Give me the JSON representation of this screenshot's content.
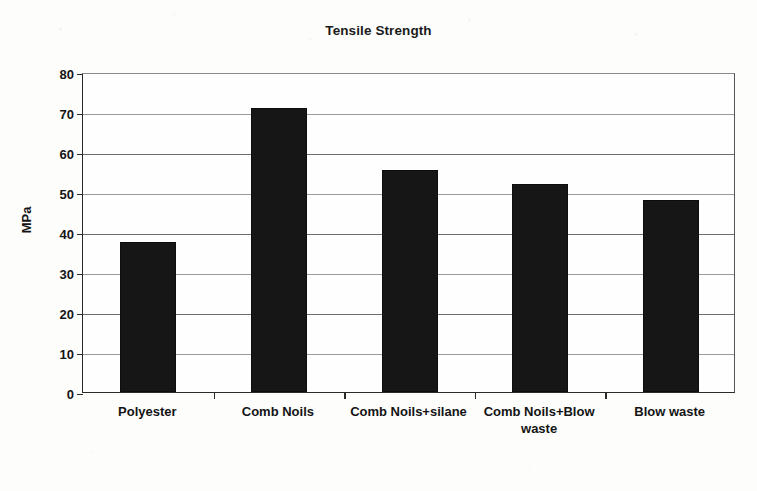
{
  "chart_data": {
    "type": "bar",
    "title": "Tensile Strength",
    "xlabel": "",
    "ylabel": "MPa",
    "categories": [
      "Polyester",
      "Comb Noils",
      "Comb Noils+silane",
      "Comb Noils+Blow waste",
      "Blow waste"
    ],
    "values": [
      37.5,
      71,
      55.5,
      52,
      48
    ],
    "ylim": [
      0,
      80
    ],
    "yticks": [
      0,
      10,
      20,
      30,
      40,
      50,
      60,
      70,
      80
    ],
    "ytick_labels": [
      "0",
      "10",
      "20",
      "30",
      "40",
      "50",
      "60",
      "70",
      "80"
    ],
    "grid": true,
    "legend": false,
    "series": [
      {
        "name": "Tensile Strength",
        "color": "#161616",
        "values": [
          37.5,
          71,
          55.5,
          52,
          48
        ]
      }
    ]
  },
  "colors": {
    "bar": "#161616",
    "axis": "#2a2a2a",
    "grid": "#6e6e6e",
    "background": "#fdfdfc",
    "text": "#141414"
  }
}
